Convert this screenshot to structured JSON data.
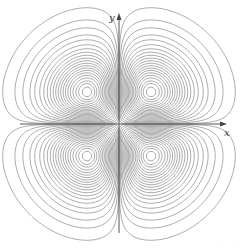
{
  "chart_data": {
    "type": "contour",
    "title": "",
    "function_description": "Level curves of f(x,y) = |xy| e^{-(x^2+y^2)/2}, four symmetric lobes, one per quadrant",
    "xlabel": "x",
    "ylabel": "y",
    "ticks": [],
    "grid": false,
    "legend": null,
    "lobe_centers": [
      [
        1,
        1
      ],
      [
        -1,
        1
      ],
      [
        -1,
        -1
      ],
      [
        1,
        -1
      ]
    ],
    "axis_range": {
      "x": [
        -3.1,
        3.4
      ],
      "y": [
        -3.4,
        3.3
      ]
    },
    "contour_levels": [
      0.003,
      0.01,
      0.02,
      0.035,
      0.05,
      0.07,
      0.09,
      0.11,
      0.13,
      0.15,
      0.17,
      0.19,
      0.21,
      0.23,
      0.25,
      0.27,
      0.29,
      0.31,
      0.33,
      0.345,
      0.36
    ],
    "line_color": "#8a8a8a",
    "axis_color": "#555555"
  },
  "plot": {
    "origin_px": [
      119,
      124
    ],
    "scale_px_per_unit": 32,
    "x_axis": {
      "from_px": 20,
      "to_px": 227
    },
    "y_axis": {
      "from_px": 233,
      "to_px": 13
    }
  },
  "labels": {
    "x": "x",
    "y": "y",
    "corner": "· ·"
  }
}
